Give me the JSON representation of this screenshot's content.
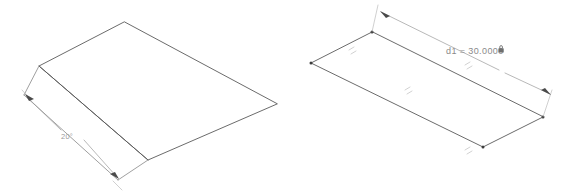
{
  "canvas": {
    "background_color": "#ffffff",
    "width": 569,
    "height": 192
  },
  "left_view": {
    "name": "folded-plate-sketch",
    "angle_dimension": {
      "label": "20°",
      "value": "20",
      "unit": "°",
      "color": "#9a9a9a"
    },
    "geometry": {
      "type": "polyline",
      "edge_color": "#5a5a5a",
      "ridge_label": "fold-ridge",
      "outline_points": "124,22 39,66 148,160 277,104",
      "ridge_points": "39,66 148,160"
    }
  },
  "right_view": {
    "name": "flat-plate-sketch",
    "linear_dimension": {
      "label": "d1 = 30.0000",
      "name": "d1",
      "value": "30.0000",
      "driven": false,
      "locked_icon": "lock-icon",
      "color": "#8a8a8a"
    },
    "geometry": {
      "type": "parallelogram",
      "edge_color": "#5a5a5a",
      "vertices": [
        {
          "name": "vertex-top",
          "x": 372,
          "y": 32
        },
        {
          "name": "vertex-left",
          "x": 311,
          "y": 63
        },
        {
          "name": "vertex-bottom",
          "x": 483,
          "y": 227
        },
        {
          "name": "vertex-right",
          "x": 543,
          "y": 197
        }
      ]
    },
    "constraints": [
      {
        "name": "parallel-constraint-top-left",
        "glyph": "parallel-marks"
      },
      {
        "name": "parallel-constraint-top-right",
        "glyph": "parallel-marks"
      },
      {
        "name": "parallel-constraint-bottom-left",
        "glyph": "parallel-marks"
      },
      {
        "name": "parallel-constraint-bottom-right",
        "glyph": "parallel-marks"
      }
    ]
  }
}
